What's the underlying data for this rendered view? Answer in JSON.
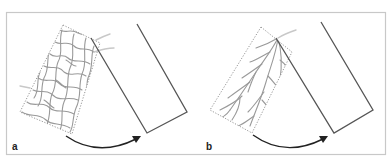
{
  "figure": {
    "panels": [
      {
        "label": "a",
        "vascular_pattern": "random network"
      },
      {
        "label": "b",
        "vascular_pattern": "axial branching"
      }
    ],
    "colors": {
      "frame": "#c8c8c8",
      "outline": "#555555",
      "dotted_outline": "#8a8a8a",
      "vessels": "#9a9a9a",
      "arrow": "#222222"
    }
  }
}
